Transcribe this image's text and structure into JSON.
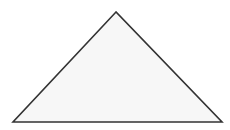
{
  "diagram": {
    "shape": "triangle",
    "vertices": [
      {
        "x": 116,
        "y": 12
      },
      {
        "x": 13,
        "y": 122
      },
      {
        "x": 222,
        "y": 122
      }
    ],
    "fill": "#f7f7f7",
    "stroke": "#333333",
    "stroke_width": 1.6,
    "background": "#ffffff"
  }
}
